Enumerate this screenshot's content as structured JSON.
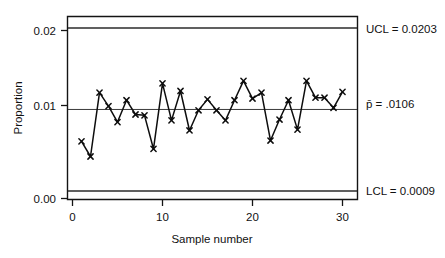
{
  "chart_data": {
    "type": "line",
    "title": "",
    "subtitle": "",
    "xlabel": "Sample number",
    "ylabel": "Proportion",
    "xlim": [
      0,
      31
    ],
    "ylim": [
      0.0,
      0.022
    ],
    "grid": false,
    "legend": "none",
    "x_ticks": [
      "0",
      "10",
      "20",
      "30"
    ],
    "x_tick_values": [
      0,
      10,
      20,
      30
    ],
    "y_ticks": [
      "0.00",
      "0.01",
      "0.02"
    ],
    "y_tick_values": [
      0.0,
      0.01,
      0.02
    ],
    "x": [
      1,
      2,
      3,
      4,
      5,
      6,
      7,
      8,
      9,
      10,
      11,
      12,
      13,
      14,
      15,
      16,
      17,
      18,
      19,
      20,
      21,
      22,
      23,
      24,
      25,
      26,
      27,
      28,
      29,
      30
    ],
    "series": [
      {
        "name": "Proportion nonconforming",
        "marker": "x",
        "values": [
          0.0068,
          0.005,
          0.0126,
          0.011,
          0.0091,
          0.0117,
          0.01,
          0.0099,
          0.0059,
          0.0137,
          0.0093,
          0.0128,
          0.0081,
          0.0105,
          0.0118,
          0.0105,
          0.0093,
          0.0117,
          0.014,
          0.0119,
          0.0126,
          0.0069,
          0.0094,
          0.0117,
          0.0082,
          0.014,
          0.012,
          0.012,
          0.0108,
          0.0127
        ]
      }
    ],
    "reference_lines": [
      {
        "name": "UCL",
        "label": "UCL = 0.0203",
        "value": 0.0203
      },
      {
        "name": "center",
        "label": "p̄ = .0106",
        "value": 0.0106
      },
      {
        "name": "LCL",
        "label": "LCL = 0.0009",
        "value": 0.0009
      }
    ],
    "annotations": {
      "ucl_label": "UCL = 0.0203",
      "center_label": "p̄ = .0106",
      "lcl_label": "LCL = 0.0009"
    },
    "colors": {
      "line": "#0d0d0d",
      "limit": "#2b2b2b",
      "center": "#3a3a3a",
      "frame": "#141414",
      "background": "#ffffff"
    }
  }
}
